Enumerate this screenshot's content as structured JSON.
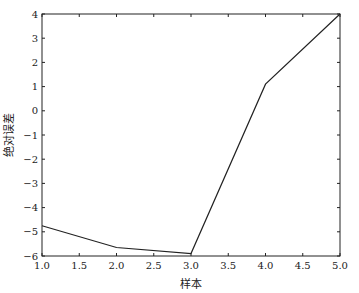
{
  "chart_data": {
    "type": "line",
    "title": "",
    "xlabel": "样本",
    "ylabel": "绝对误差",
    "x": [
      1,
      2,
      3,
      4,
      5
    ],
    "series": [
      {
        "name": "绝对误差",
        "values": [
          -4.75,
          -5.65,
          -5.9,
          1.1,
          4.0
        ],
        "color": "#222222"
      }
    ],
    "xlim": [
      1.0,
      5.0
    ],
    "ylim": [
      -6,
      4
    ],
    "xticks": [
      "1.0",
      "1.5",
      "2.0",
      "2.5",
      "3.0",
      "3.5",
      "4.0",
      "4.5",
      "5.0"
    ],
    "yticks": [
      "4",
      "3",
      "2",
      "1",
      "0",
      "−1",
      "−2",
      "−3",
      "−4",
      "−5",
      "−6"
    ],
    "grid": false,
    "legend": null
  }
}
